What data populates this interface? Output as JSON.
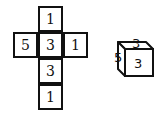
{
  "net": {
    "cells": [
      {
        "id": "top",
        "value": "1",
        "col": 1,
        "row": 0
      },
      {
        "id": "left",
        "value": "5",
        "col": 0,
        "row": 1
      },
      {
        "id": "center",
        "value": "3",
        "col": 1,
        "row": 1
      },
      {
        "id": "right",
        "value": "1",
        "col": 2,
        "row": 1
      },
      {
        "id": "below-center",
        "value": "3",
        "col": 1,
        "row": 2
      },
      {
        "id": "bottom",
        "value": "1",
        "col": 1,
        "row": 3
      }
    ]
  },
  "cube": {
    "top_face": "3",
    "left_face": "5",
    "front_face": "3"
  },
  "colors": {
    "line": "#111111",
    "background": "#ffffff"
  }
}
